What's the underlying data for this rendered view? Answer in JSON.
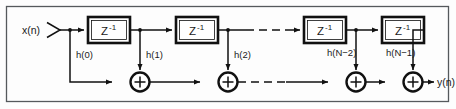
{
  "figure": {
    "name": "fir-filter-block-diagram",
    "type": "signal-flow-diagram",
    "border_color": "#55595c",
    "line_color": "#111111",
    "background_color": "#fdfdfd"
  },
  "signals": {
    "input_label": "x(n)",
    "output_label": "y(n)"
  },
  "delay_blocks": [
    {
      "id": "z1",
      "label": "Z",
      "exponent": "-1"
    },
    {
      "id": "z2",
      "label": "Z",
      "exponent": "-1"
    },
    {
      "id": "z3",
      "label": "Z",
      "exponent": "-1"
    },
    {
      "id": "z4",
      "label": "Z",
      "exponent": "-1"
    }
  ],
  "coefficients": [
    {
      "id": "h0",
      "label": "h(0)"
    },
    {
      "id": "h1",
      "label": "h(1)"
    },
    {
      "id": "h2",
      "label": "h(2)"
    },
    {
      "id": "hn2",
      "label": "h(N−2)"
    },
    {
      "id": "hn1",
      "label": "h(N−1)"
    }
  ],
  "adders": [
    {
      "id": "sum1",
      "symbol": "+"
    },
    {
      "id": "sum2",
      "symbol": "+"
    },
    {
      "id": "sum3",
      "symbol": "+"
    },
    {
      "id": "sum4",
      "symbol": "+"
    }
  ],
  "continuation": {
    "top_label": "dashed-continuation",
    "bottom_label": "dashed-continuation"
  }
}
